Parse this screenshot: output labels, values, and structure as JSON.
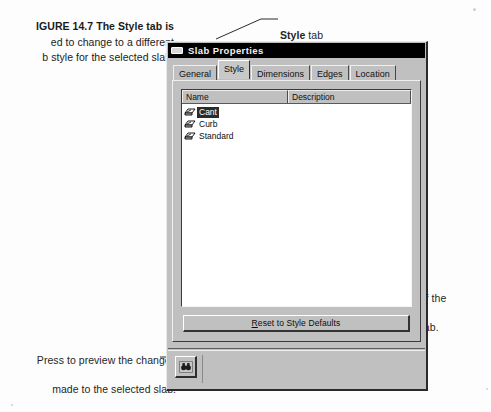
{
  "figure": {
    "label": "FIGURE 14.7",
    "caption": "The Style tab is used to change to a different slab style for the selected slab.",
    "caption_visible_line1": "IGURE 14.7   The Style tab is",
    "caption_visible_line2": "ed to change to a different",
    "caption_visible_line3": "b style for the selected slab."
  },
  "annotations": {
    "style_tab_bold": "Style",
    "style_tab_rest": " tab",
    "select_style": "Select a new style to use.",
    "default_props_line1": "Press to set the default properties of the",
    "default_props_line2": "new style to the existing selected slab.",
    "preview_line1": "Press to preview the changes",
    "preview_line2": "made to the selected slab."
  },
  "dialog": {
    "title": "Slab Properties",
    "title_icon": "slab-window-icon",
    "tabs": [
      {
        "label": "General",
        "active": false
      },
      {
        "label": "Style",
        "active": true
      },
      {
        "label": "Dimensions",
        "active": false
      },
      {
        "label": "Edges",
        "active": false
      },
      {
        "label": "Location",
        "active": false
      }
    ],
    "list": {
      "columns": [
        "Name",
        "Description"
      ],
      "rows": [
        {
          "name": "Cant",
          "description": "",
          "selected": true,
          "icon": "slab-style-icon"
        },
        {
          "name": "Curb",
          "description": "",
          "selected": false,
          "icon": "slab-style-icon"
        },
        {
          "name": "Standard",
          "description": "",
          "selected": false,
          "icon": "slab-style-icon"
        }
      ]
    },
    "reset_button": {
      "mnemonic": "R",
      "label_rest": "eset to Style Defaults",
      "full_label": "Reset to Style Defaults"
    },
    "preview_button": {
      "icon": "binoculars-preview-icon",
      "label": ""
    }
  },
  "colors": {
    "dialog_face": "#c0c0c0",
    "titlebar": "#000000",
    "titlebar_text": "#f2f2f2",
    "list_background": "#ffffff",
    "selection": "#2b2b2b",
    "selection_text": "#ffffff",
    "page": "#fdfdfd"
  }
}
